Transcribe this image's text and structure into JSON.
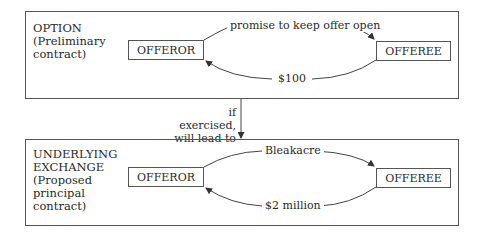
{
  "option": {
    "title": "OPTION",
    "subtitle_lines": [
      "(Preliminary",
      "contract)"
    ],
    "left_party": "OFFEROR",
    "right_party": "OFFEREE",
    "top_flow": "promise to keep offer open",
    "bottom_flow": "$100"
  },
  "connector": {
    "lines": [
      "if exercised,",
      "will lead to"
    ]
  },
  "exchange": {
    "title_lines": [
      "UNDERLYING",
      "EXCHANGE"
    ],
    "subtitle_lines": [
      "(Proposed",
      "principal",
      "contract)"
    ],
    "left_party": "OFFEROR",
    "right_party": "OFFEREE",
    "top_flow": "Bleakacre",
    "bottom_flow": "$2 million"
  }
}
